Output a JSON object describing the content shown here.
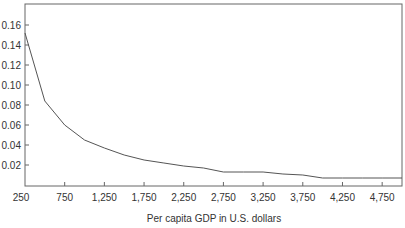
{
  "chart_data": {
    "type": "line",
    "title": "",
    "xlabel": "Per capita GDP in U.S. dollars",
    "ylabel": "",
    "xlim": [
      250,
      5000
    ],
    "ylim": [
      0,
      0.17
    ],
    "grid": false,
    "legend": null,
    "x_ticks": [
      250,
      750,
      1250,
      1750,
      2250,
      2750,
      3250,
      3750,
      4250,
      4750
    ],
    "x_tick_labels": [
      "250",
      "750",
      "1,250",
      "1,750",
      "2,250",
      "2,750",
      "3,250",
      "3,750",
      "4,250",
      "4,750"
    ],
    "y_ticks": [
      0.02,
      0.04,
      0.06,
      0.08,
      0.1,
      0.12,
      0.14,
      0.16
    ],
    "y_tick_labels": [
      "0.02",
      "0.04",
      "0.06",
      "0.08",
      "0.10",
      "0.12",
      "0.14",
      "0.16"
    ],
    "series": [
      {
        "name": "",
        "color": "#555555",
        "x": [
          250,
          500,
          750,
          1000,
          1250,
          1500,
          1750,
          2000,
          2250,
          2500,
          2750,
          3000,
          3250,
          3500,
          3750,
          4000,
          4250,
          4500,
          4750,
          5000
        ],
        "y": [
          0.152,
          0.084,
          0.06,
          0.045,
          0.037,
          0.03,
          0.025,
          0.022,
          0.019,
          0.017,
          0.013,
          0.013,
          0.013,
          0.011,
          0.01,
          0.007,
          0.007,
          0.007,
          0.007,
          0.007
        ]
      }
    ]
  }
}
